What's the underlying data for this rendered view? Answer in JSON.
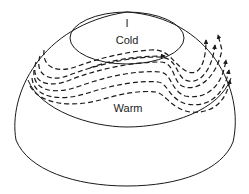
{
  "diagram": {
    "type": "hemisphere-circulation",
    "labels": {
      "pole_marker": "I",
      "cold": "Cold",
      "warm": "Warm"
    },
    "colors": {
      "line": "#1a1a1a",
      "background": "#ffffff"
    },
    "regions": [
      {
        "name": "cold-polar-cap",
        "label": "Cold"
      },
      {
        "name": "warm-lower-latitudes",
        "label": "Warm"
      },
      {
        "name": "wavy-jet-stream-band",
        "label": ""
      }
    ]
  }
}
